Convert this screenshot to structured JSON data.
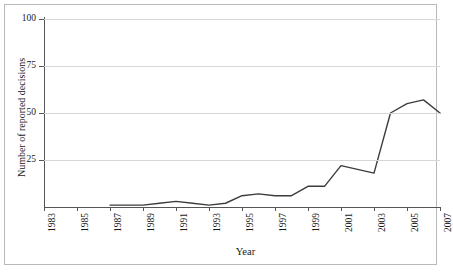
{
  "chart_data": {
    "type": "line",
    "title": "",
    "subtitle": "",
    "xlabel": "Year",
    "ylabel": "Number of reported decisions",
    "xlim": [
      1983,
      2007
    ],
    "ylim": [
      0,
      100
    ],
    "grid": true,
    "legend": null,
    "line_color": "#3d3d3d",
    "gridline_color": "#d6d6d6",
    "axis_color": "#555555",
    "y_ticks": [
      25,
      50,
      75,
      100
    ],
    "y_tick_labels": [
      "25",
      "50",
      "75",
      "100"
    ],
    "x_ticks": [
      1983,
      1985,
      1987,
      1989,
      1991,
      1993,
      1995,
      1997,
      1999,
      2001,
      2003,
      2005,
      2007
    ],
    "x_tick_labels": [
      "1983",
      "1985",
      "1987",
      "1989",
      "1991",
      "1993",
      "1995",
      "1997",
      "1999",
      "2001",
      "2003",
      "2005",
      "2007"
    ],
    "x": [
      1987,
      1988,
      1989,
      1990,
      1991,
      1992,
      1993,
      1994,
      1995,
      1996,
      1997,
      1998,
      1999,
      2000,
      2001,
      2002,
      2003,
      2004,
      2005,
      2006,
      2007
    ],
    "values": [
      1,
      1,
      1,
      2,
      3,
      2,
      1,
      2,
      6,
      7,
      6,
      6,
      11,
      11,
      22,
      20,
      18,
      50,
      55,
      57,
      50
    ],
    "series": [
      {
        "name": "Reported decisions",
        "x": [
          1987,
          1988,
          1989,
          1990,
          1991,
          1992,
          1993,
          1994,
          1995,
          1996,
          1997,
          1998,
          1999,
          2000,
          2001,
          2002,
          2003,
          2004,
          2005,
          2006,
          2007
        ],
        "values": [
          1,
          1,
          1,
          2,
          3,
          2,
          1,
          2,
          6,
          7,
          6,
          6,
          11,
          11,
          22,
          20,
          18,
          50,
          55,
          57,
          50
        ]
      }
    ]
  }
}
